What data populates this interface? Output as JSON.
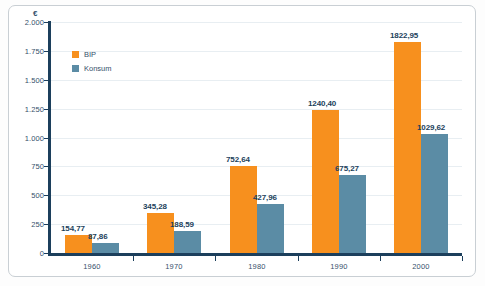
{
  "chart_data": {
    "type": "bar",
    "title": "",
    "subtitle": "",
    "xlabel": "",
    "ylabel": "€",
    "categories": [
      "1960",
      "1970",
      "1980",
      "1990",
      "2000"
    ],
    "series": [
      {
        "name": "BIP",
        "color": "#f7901e",
        "values": [
          154.77,
          345.28,
          752.64,
          1240.4,
          1822.95
        ],
        "value_labels": [
          "154,77",
          "345,28",
          "752,64",
          "1240,40",
          "1822,95"
        ]
      },
      {
        "name": "Konsum",
        "color": "#5b8ca5",
        "values": [
          87.86,
          188.59,
          427.96,
          675.27,
          1029.62
        ],
        "value_labels": [
          "87,86",
          "188,59",
          "427,96",
          "675,27",
          "1029,62"
        ]
      }
    ],
    "ylim": [
      0,
      2000
    ],
    "yticks": [
      0,
      250,
      500,
      750,
      1000,
      1250,
      1500,
      1750,
      2000
    ],
    "ytick_labels": [
      "0",
      "250",
      "500",
      "750",
      "1.000",
      "1.250",
      "1.500",
      "1.750",
      "2.000"
    ],
    "grid": true,
    "legend_position": "top-left",
    "currency_symbol": "€",
    "colors": {
      "bip": "#f7901e",
      "konsum": "#5b8ca5",
      "axis": "#1c3f5c",
      "grid": "#e8eef2",
      "text": "#36506b",
      "frame": "#c9cfd4"
    }
  },
  "legend": {
    "items": [
      {
        "label": "BIP",
        "color": "#f7901e"
      },
      {
        "label": "Konsum",
        "color": "#5b8ca5"
      }
    ]
  },
  "axes": {
    "y_unit": "€"
  }
}
